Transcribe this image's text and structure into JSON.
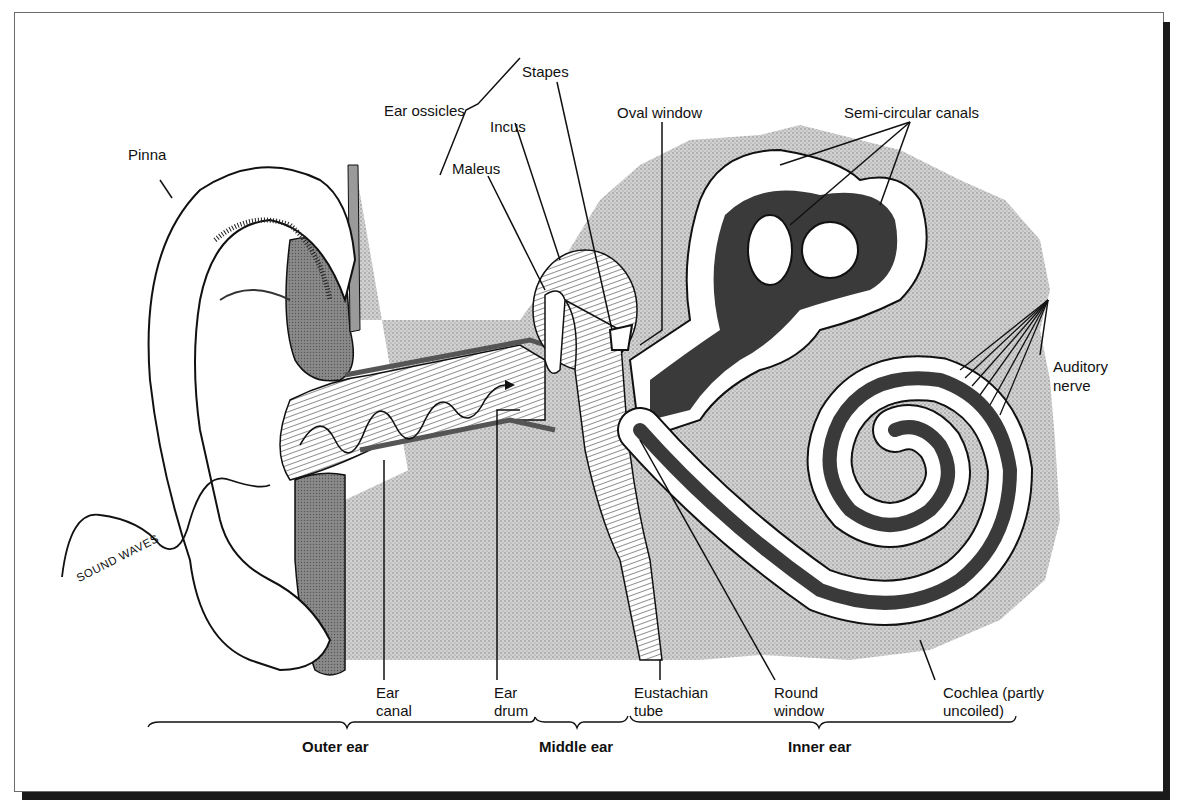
{
  "diagram": {
    "labels": {
      "ear_ossicles": "Ear ossicles",
      "stapes": "Stapes",
      "incus": "Incus",
      "maleus": "Maleus",
      "oval_window": "Oval window",
      "semi_circular_canals": "Semi-circular canals",
      "pinna": "Pinna",
      "auditory_nerve_line1": "Auditory",
      "auditory_nerve_line2": "nerve",
      "sound_waves": "SOUND WAVES",
      "ear_canal_line1": "Ear",
      "ear_canal_line2": "canal",
      "ear_drum_line1": "Ear",
      "ear_drum_line2": "drum",
      "eustachian_tube_line1": "Eustachian",
      "eustachian_tube_line2": "tube",
      "round_window_line1": "Round",
      "round_window_line2": "window",
      "cochlea_line1": "Cochlea (partly",
      "cochlea_line2": "uncoiled)"
    },
    "regions": {
      "outer_ear": "Outer ear",
      "middle_ear": "Middle ear",
      "inner_ear": "Inner ear"
    },
    "colors": {
      "ink": "#111111",
      "bone_stipple": "#c8c8c8",
      "dark_fluid": "#3a3a3a",
      "tissue_gray": "#8a8a8a",
      "frame_shadow": "#1a1a1a"
    }
  }
}
